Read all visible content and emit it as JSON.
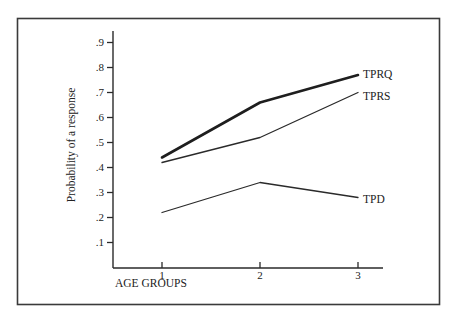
{
  "chart_data": {
    "type": "line",
    "title": "",
    "xlabel": "AGE GROUPS",
    "ylabel": "Probability of a response",
    "categories": [
      "1",
      "2",
      "3"
    ],
    "x": [
      1,
      2,
      3
    ],
    "y_ticks": [
      ".1",
      ".2",
      ".3",
      ".4",
      ".5",
      ".6",
      ".7",
      ".8",
      ".9"
    ],
    "y_tick_values": [
      0.1,
      0.2,
      0.3,
      0.4,
      0.5,
      0.6,
      0.7,
      0.8,
      0.9
    ],
    "ylim": [
      0,
      0.9
    ],
    "grid": false,
    "legend": "inline labels at line ends (right)",
    "series": [
      {
        "name": "TPRQ",
        "values": [
          0.44,
          0.66,
          0.77
        ],
        "stroke_width": 2.6,
        "color": "#1e1e1e"
      },
      {
        "name": "TPRS",
        "values": [
          0.42,
          0.52,
          0.7
        ],
        "stroke_width": 1.3,
        "color": "#2a2a2a"
      },
      {
        "name": "TPD",
        "values": [
          0.22,
          0.34,
          0.28
        ],
        "stroke_width": 1.3,
        "color": "#2a2a2a"
      }
    ]
  },
  "colors": {
    "frame": "#3a3a3a",
    "axis": "#2a2a2a",
    "background": "#ffffff"
  }
}
